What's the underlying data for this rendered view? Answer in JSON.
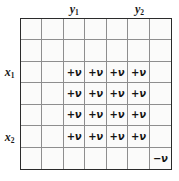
{
  "figure": {
    "type": "grid-diagram",
    "background_color": "#ffffff",
    "grid_fill_color": "#fbfbfa",
    "grid_line_color": "#8e8e8e",
    "grid_border_color": "#2b2b2b",
    "text_color": "#141414",
    "rows": 7,
    "columns": 7
  },
  "column_labels": [
    {
      "text": "y",
      "subscript": "1",
      "column_index": 2
    },
    {
      "text": "y",
      "subscript": "2",
      "column_index": 5
    }
  ],
  "row_labels": [
    {
      "text": "x",
      "subscript": "1",
      "row_index": 2
    },
    {
      "text": "x",
      "subscript": "2",
      "row_index": 5
    }
  ],
  "cells": [
    [
      "",
      "",
      "",
      "",
      "",
      "",
      ""
    ],
    [
      "",
      "",
      "",
      "",
      "",
      "",
      ""
    ],
    [
      "",
      "",
      "+ν",
      "+ν",
      "+ν",
      "+ν",
      ""
    ],
    [
      "",
      "",
      "+ν",
      "+ν",
      "+ν",
      "+ν",
      ""
    ],
    [
      "",
      "",
      "+ν",
      "+ν",
      "+ν",
      "+ν",
      ""
    ],
    [
      "",
      "",
      "+ν",
      "+ν",
      "+ν",
      "+ν",
      ""
    ],
    [
      "",
      "",
      "",
      "",
      "",
      "",
      "−ν"
    ]
  ],
  "symbols": {
    "positive": "+ν",
    "negative": "−ν",
    "nu": "ν",
    "plus": "+",
    "minus": "−"
  }
}
